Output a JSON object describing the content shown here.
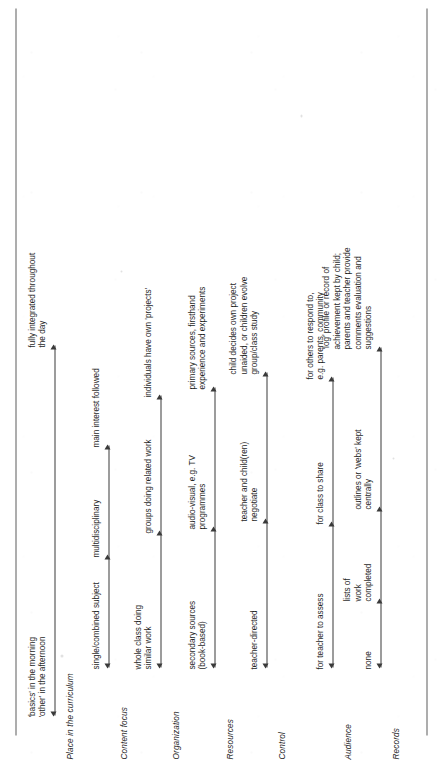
{
  "document": {
    "type": "continuum-table",
    "orientation": "rotated-90-ccw",
    "description": "Educational continuum diagram comparing subject-based teaching with integrated project work across seven dimensions."
  },
  "rows": [
    {
      "label": "Place in the curriculum",
      "stops": [
        "'basics' in the morning\n'other' in the afternoon",
        "fully integrated throughout\nthe day"
      ]
    },
    {
      "label": "Content focus",
      "stops": [
        "single/combined subject",
        "multidisciplinary",
        "main interest followed"
      ]
    },
    {
      "label": "Organization",
      "stops": [
        "whole class doing\nsimilar work",
        "groups doing related work",
        "individuals have own 'projects'"
      ]
    },
    {
      "label": "Resources",
      "stops": [
        "secondary sources\n(book-based)",
        "audio-visual, e.g. TV\nprogrammes",
        "primary sources, firsthand\nexperience and experiments"
      ]
    },
    {
      "label": "Control",
      "stops": [
        "teacher-directed",
        "teacher and child(ren)\nnegotiate",
        "child decides own project\nunaided, or children evolve\ngroup/class study"
      ]
    },
    {
      "label": "Audience",
      "stops": [
        "for teacher to assess",
        "for class to share",
        "for others to respond to,\ne.g. parents, community"
      ]
    },
    {
      "label": "Records",
      "stops": [
        "none",
        "lists of\nwork\ncompleted",
        "outlines or 'webs' kept\ncentrally",
        "'log' profile or record of\nachievement kept by child;\nparents and teacher provide\ncomments evaluation and\nsuggestions"
      ]
    }
  ],
  "colors": {
    "ink": "#1f1f1f",
    "rule": "#5d5d5d",
    "arrow": "#3a3a3a",
    "paper": "#ffffff"
  }
}
